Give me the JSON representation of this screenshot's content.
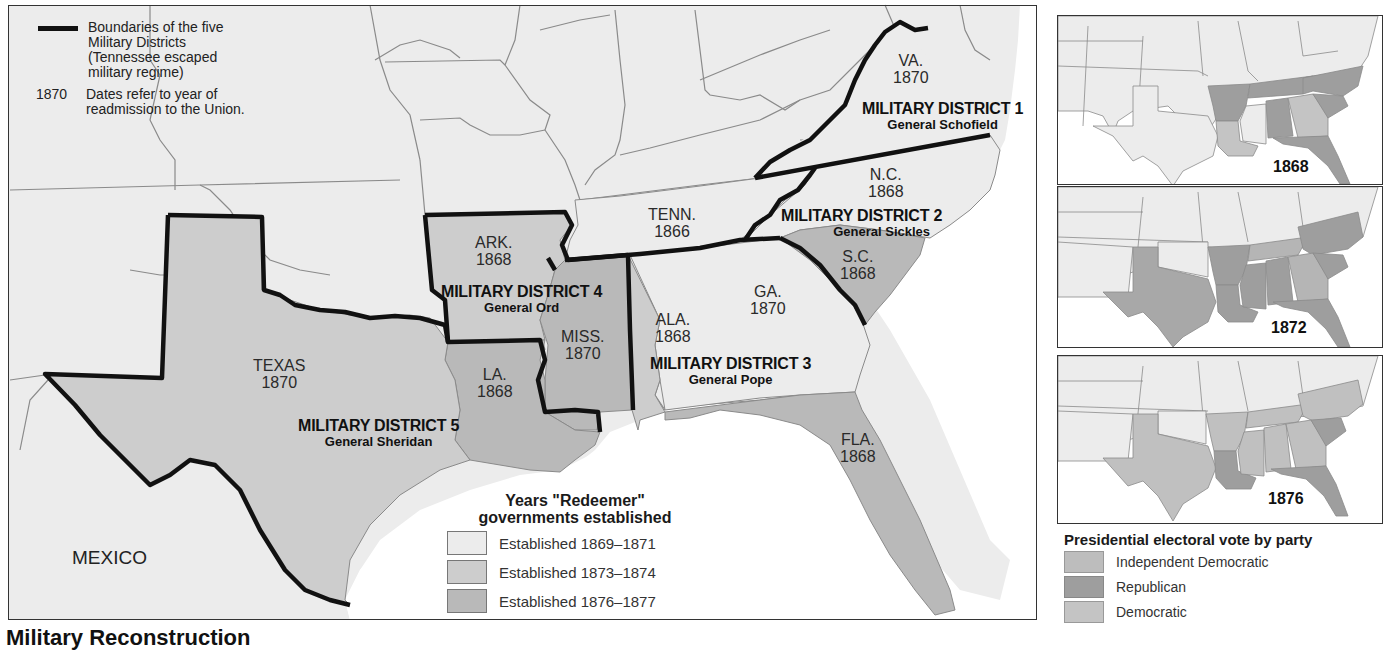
{
  "map": {
    "top_legend": {
      "boundary_label": "Boundaries of the five Military Districts (Tennessee escaped military regime)",
      "boundary_lines": [
        "Boundaries of the five",
        "Military Districts",
        "(Tennessee escaped",
        "military regime)"
      ],
      "date_sample": "1870",
      "date_lines": [
        "Dates refer to year of",
        "readmission to the Union."
      ]
    },
    "states": [
      {
        "name": "VA.",
        "year": "1870"
      },
      {
        "name": "N.C.",
        "year": "1868"
      },
      {
        "name": "TENN.",
        "year": "1866"
      },
      {
        "name": "S.C.",
        "year": "1868"
      },
      {
        "name": "ARK.",
        "year": "1868"
      },
      {
        "name": "GA.",
        "year": "1870"
      },
      {
        "name": "ALA.",
        "year": "1868"
      },
      {
        "name": "MISS.",
        "year": "1870"
      },
      {
        "name": "LA.",
        "year": "1868"
      },
      {
        "name": "TEXAS",
        "year": "1870"
      },
      {
        "name": "FLA.",
        "year": "1868"
      }
    ],
    "districts": [
      {
        "name": "MILITARY DISTRICT 1",
        "general": "General Schofield"
      },
      {
        "name": "MILITARY DISTRICT 2",
        "general": "General Sickles"
      },
      {
        "name": "MILITARY DISTRICT 3",
        "general": "General Pope"
      },
      {
        "name": "MILITARY DISTRICT 4",
        "general": "General Ord"
      },
      {
        "name": "MILITARY DISTRICT 5",
        "general": "General Sheridan"
      }
    ],
    "country_label": "MEXICO",
    "redeemer_legend": {
      "title_line1": "Years \"Redeemer\"",
      "title_line2": "governments established",
      "items": [
        {
          "label": "Established 1869–1871",
          "color": "#ececec"
        },
        {
          "label": "Established 1873–1874",
          "color": "#cdcdcd"
        },
        {
          "label": "Established 1876–1877",
          "color": "#b9b9b9"
        }
      ]
    }
  },
  "insets": [
    {
      "year": "1868"
    },
    {
      "year": "1872"
    },
    {
      "year": "1876"
    }
  ],
  "party_legend": {
    "title": "Presidential electoral vote by party",
    "items": [
      {
        "label": "Independent Democratic",
        "color": "#bdbdbd"
      },
      {
        "label": "Republican",
        "color": "#9e9e9e"
      },
      {
        "label": "Democratic",
        "color": "#c4c4c4"
      }
    ]
  },
  "caption": "Military Reconstruction"
}
